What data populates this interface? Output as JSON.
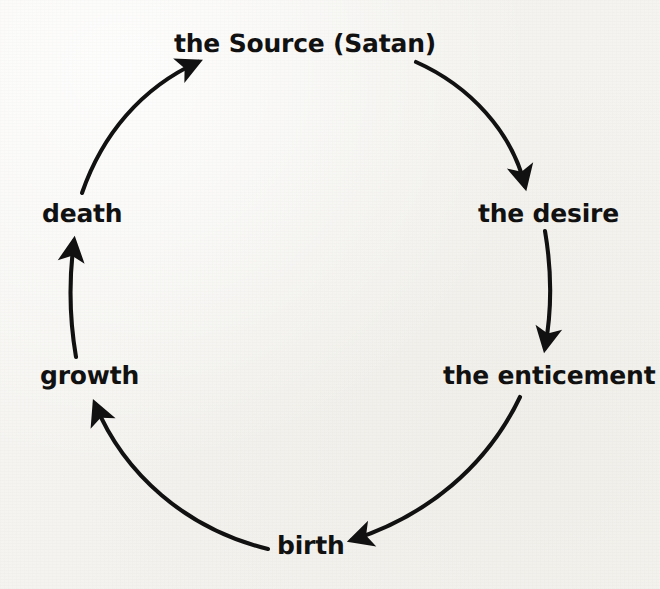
{
  "diagram": {
    "type": "cycle-diagram",
    "title": "",
    "direction": "clockwise",
    "background_color": "#f6f5f2",
    "stroke_color": "#111111",
    "text_color": "#111111",
    "nodes": [
      {
        "id": "source",
        "label": "the Source (Satan)",
        "position": "top",
        "x": 305,
        "y": 45
      },
      {
        "id": "desire",
        "label": "the desire",
        "position": "upper-right",
        "x": 539,
        "y": 214
      },
      {
        "id": "enticement",
        "label": "the enticement",
        "position": "lower-right",
        "x": 536,
        "y": 376
      },
      {
        "id": "birth",
        "label": "birth",
        "position": "bottom",
        "x": 307,
        "y": 546
      },
      {
        "id": "growth",
        "label": "growth",
        "position": "lower-left",
        "x": 84,
        "y": 376
      },
      {
        "id": "death",
        "label": "death",
        "position": "upper-left",
        "x": 77,
        "y": 214
      }
    ],
    "edges": [
      {
        "from": "source",
        "to": "desire",
        "arrowhead": "down-right"
      },
      {
        "from": "desire",
        "to": "enticement",
        "arrowhead": "down"
      },
      {
        "from": "enticement",
        "to": "birth",
        "arrowhead": "left"
      },
      {
        "from": "birth",
        "to": "growth",
        "arrowhead": "up"
      },
      {
        "from": "growth",
        "to": "death",
        "arrowhead": "up"
      },
      {
        "from": "death",
        "to": "source",
        "arrowhead": "up-right"
      }
    ]
  }
}
